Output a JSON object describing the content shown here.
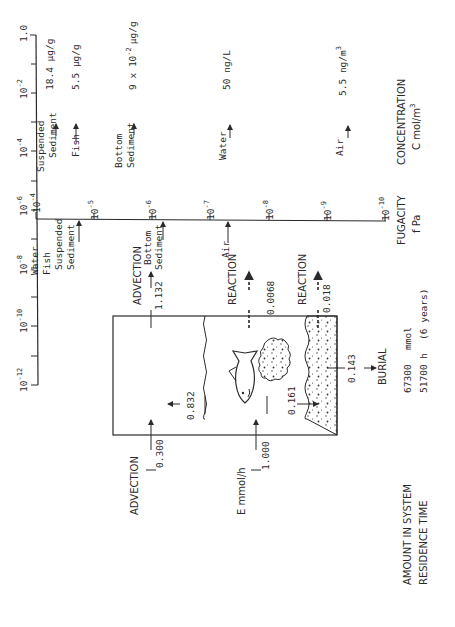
{
  "figure": {
    "orientation": "rotated-90-ccw",
    "concentration_axis": {
      "title": "CONCENTRATION",
      "unit_label": "C  mol/m",
      "unit_exp": "3",
      "ticks": [
        {
          "label": "1.0",
          "exp": ""
        },
        {
          "label": "10",
          "exp": "-2"
        },
        {
          "label": "10",
          "exp": "-4"
        },
        {
          "label": "10",
          "exp": "-6"
        },
        {
          "label": "10",
          "exp": "-8"
        },
        {
          "label": "10",
          "exp": "-10"
        },
        {
          "label": "10",
          "exp": "-12"
        }
      ],
      "markers": [
        {
          "name": "Suspended Sediment",
          "line1": "Suspended",
          "line2": "Sediment",
          "value": "18.4 µg/g"
        },
        {
          "name": "Fish",
          "line1": "Fish",
          "line2": "",
          "value": "5.5 µg/g"
        },
        {
          "name": "Bottom Sediment",
          "line1": "Bottom",
          "line2": "Sediment",
          "value_prefix": "9 x 10",
          "value_exp": "-2",
          "value_unit": "µg/g"
        },
        {
          "name": "Water",
          "line1": "Water",
          "line2": "",
          "value": "50 ng/L"
        },
        {
          "name": "Air",
          "line1": "Air",
          "line2": "",
          "value_prefix": "5.5 ng/m",
          "value_exp": "3"
        }
      ]
    },
    "fugacity_axis": {
      "title": "FUGACITY",
      "unit_label": "f  Pa",
      "ticks": [
        {
          "label": "10",
          "exp": "-4"
        },
        {
          "label": "10",
          "exp": "-5"
        },
        {
          "label": "10",
          "exp": "-6"
        },
        {
          "label": "10",
          "exp": "-7"
        },
        {
          "label": "10",
          "exp": "-8"
        },
        {
          "label": "10",
          "exp": "-9"
        },
        {
          "label": "10",
          "exp": "-10"
        }
      ],
      "markers": [
        {
          "lines": [
            "Water",
            "Fish",
            "Suspended",
            "Sediment"
          ]
        },
        {
          "lines": [
            "Bottom",
            "Sediment"
          ]
        },
        {
          "lines": [
            "Air"
          ]
        }
      ]
    },
    "box": {
      "inputs": {
        "advection_in_label": "ADVECTION",
        "advection_in_value": "0.300",
        "emission_label": "E  mmol/h",
        "emission_value": "1.000"
      },
      "flows": {
        "advection_out_label": "ADVECTION",
        "advection_out_value": "1.132",
        "water_reaction_label": "REACTION",
        "water_reaction_value": "0.0068",
        "sediment_reaction_label": "REACTION",
        "sediment_reaction_value": "0.018",
        "water_to_air_value": "0.832",
        "deposition_value": "0.161",
        "burial_value": "0.143",
        "burial_label": "BURIAL"
      }
    },
    "summary": {
      "amount_label": "AMOUNT IN SYSTEM",
      "amount_value": "67300",
      "amount_unit": "mmol",
      "residence_label": "RESIDENCE TIME",
      "residence_value": "51700 h",
      "residence_note": "(6 years)"
    }
  }
}
